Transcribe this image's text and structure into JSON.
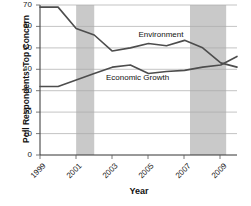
{
  "chart_data": {
    "type": "line",
    "title": "",
    "subtitle": "",
    "xlabel": "Year",
    "ylabel": "Poll Respondents' Top Concern",
    "xlim": [
      1999,
      2009.9
    ],
    "ylim": [
      0,
      70
    ],
    "ytick_values": [
      0,
      10,
      20,
      30,
      40,
      50,
      60,
      70
    ],
    "ytick_labels": [
      "0",
      "10",
      "20",
      "30",
      "40",
      "50",
      "60",
      "70"
    ],
    "xtick_values": [
      1999,
      2001,
      2003,
      2005,
      2007,
      2009
    ],
    "xtick_labels": [
      "1999",
      "2001",
      "2003",
      "2005",
      "2007",
      "2009"
    ],
    "grid": "horizontal",
    "legend_position": "inline-annotations",
    "line_color": "#4d4d4d",
    "shaded_band_color": "#c9c9c9",
    "x": [
      1999,
      2000,
      2001,
      2002,
      2003,
      2004,
      2005,
      2006,
      2007,
      2008,
      2009,
      2009.9
    ],
    "series": [
      {
        "name": "Environment",
        "values": [
          69,
          69,
          59,
          56,
          48.5,
          50,
          52,
          51,
          53.5,
          50,
          43,
          41
        ]
      },
      {
        "name": "Economic Growth",
        "values": [
          32,
          32,
          35,
          38,
          41,
          42,
          38,
          39,
          39.5,
          41,
          42,
          46
        ]
      }
    ],
    "annotations": [
      {
        "text": "Environment",
        "x": 2006.0,
        "y": 56
      },
      {
        "text": "Economic Growth",
        "x": 2004.2,
        "y": 36
      }
    ],
    "shaded_bands": [
      {
        "label": "recession-band-1",
        "x_start": 2001.0,
        "x_end": 2002.0
      },
      {
        "label": "recession-band-2",
        "x_start": 2007.3,
        "x_end": 2009.3
      }
    ]
  }
}
